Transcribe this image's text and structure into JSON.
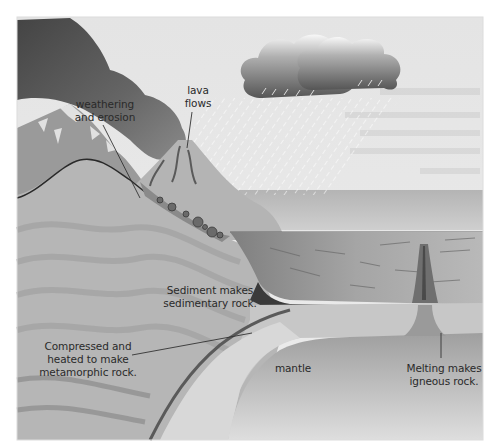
{
  "diagram": {
    "colors": {
      "sky": "#e6e6e6",
      "smoke_dark": "#4a4a4a",
      "smoke_mid": "#7a7a7a",
      "mountain": "#a9a9a9",
      "snow": "#eeeeee",
      "crust_left": "#b4b4b4",
      "crust_band": "#9c9c9c",
      "sea": "#c8c8c8",
      "ocean_sediment": "#8e8e8e",
      "ocean_crust": "#c0c0c0",
      "mantle": "#a6a6a6",
      "subducting_slab": "#d6d6d6",
      "label_text": "#2a2a2a",
      "leader_line": "#333333"
    },
    "labels": {
      "lava_flows": "lava\nflows",
      "weathering": "weathering\nand erosion",
      "sediment": "Sediment makes\nsedimentary rock.",
      "metamorphic": "Compressed and\nheated to make\nmetamorphic rock.",
      "mantle": "mantle",
      "igneous": "Melting makes\nigneous rock."
    },
    "features": [
      "volcano",
      "ash-cloud",
      "rain-clouds",
      "rain",
      "mountain",
      "sea",
      "sediment-layers",
      "oceanic-crust",
      "subduction-zone",
      "mantle",
      "magma-dyke"
    ]
  }
}
